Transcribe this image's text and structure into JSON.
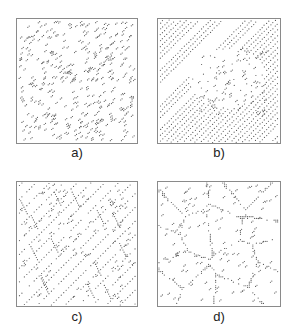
{
  "figure": {
    "panels": [
      {
        "id": "a",
        "label": "a)",
        "pattern": "random",
        "description": "random scattered atoms"
      },
      {
        "id": "b",
        "label": "b)",
        "pattern": "diagonal-lines",
        "description": "diagonal lines with some grain boundaries"
      },
      {
        "id": "c",
        "label": "c)",
        "pattern": "elongated-grains",
        "description": "elongated grains along diagonal"
      },
      {
        "id": "d",
        "label": "d)",
        "pattern": "polycrystal-grains",
        "description": "equiaxed polygonal grains"
      }
    ],
    "colors": {
      "dots": "#5a5a5a",
      "border": "#8a8a8a",
      "background": "#ffffff"
    }
  }
}
